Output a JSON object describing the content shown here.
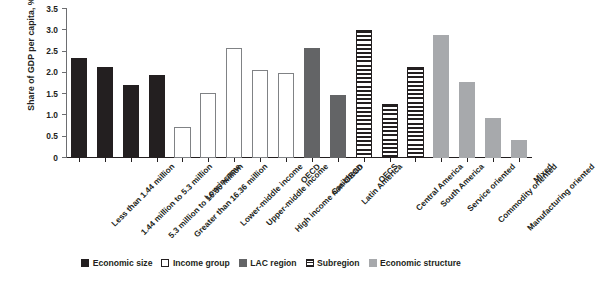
{
  "chart_data": {
    "type": "bar",
    "title": "",
    "subtitle": "",
    "xlabel": "",
    "ylabel": "Share of GDP per capita, %",
    "ylim": [
      0,
      3.5
    ],
    "ytick_labels": [
      "0",
      "0.5",
      "1.0",
      "1.5",
      "2.0",
      "2.5",
      "3.0",
      "3.5"
    ],
    "ytick_values": [
      0,
      0.5,
      1.0,
      1.5,
      2.0,
      2.5,
      3.0,
      3.5
    ],
    "grid": false,
    "legend_position": "bottom",
    "categories": [
      "Less than 1.44 million",
      "1.44 million to 5.3 million",
      "5.3 million to 16.36 million",
      "Greater than 16.36 million",
      "Low income",
      "Lower-middle income",
      "Upper-middle income",
      "High income non-OECD",
      "OECD",
      "Caribbean",
      "Latin America",
      "OECS",
      "Central America",
      "South America",
      "Service oriented",
      "Commodity oriented",
      "Manufacturing oriented",
      "Mixed"
    ],
    "values": [
      2.35,
      2.13,
      1.72,
      1.95,
      0.73,
      1.52,
      2.58,
      2.07,
      2.0,
      2.58,
      1.47,
      3.0,
      1.27,
      2.13,
      2.9,
      1.79,
      0.95,
      0.42
    ],
    "groups": [
      "Economic size",
      "Economic size",
      "Economic size",
      "Economic size",
      "Income group",
      "Income group",
      "Income group",
      "Income group",
      "Income group",
      "LAC region",
      "LAC region",
      "Subregion",
      "Subregion",
      "Subregion",
      "Economic structure",
      "Economic structure",
      "Economic structure",
      "Economic structure"
    ],
    "styles": [
      "solid-black",
      "solid-black",
      "solid-black",
      "solid-black",
      "outline-white",
      "outline-white",
      "outline-white",
      "outline-white",
      "outline-white",
      "solid-dark",
      "solid-dark",
      "striped",
      "striped",
      "striped",
      "solid-light",
      "solid-light",
      "solid-light",
      "solid-light"
    ],
    "legend": [
      {
        "label": "Economic size",
        "style": "solid-black",
        "color": "#231f20"
      },
      {
        "label": "Income group",
        "style": "outline-white",
        "color": "#ffffff"
      },
      {
        "label": "LAC region",
        "style": "solid-dark",
        "color": "#636466"
      },
      {
        "label": "Subregion",
        "style": "striped",
        "color": "#231f20"
      },
      {
        "label": "Economic structure",
        "style": "solid-light",
        "color": "#a7a9ac"
      }
    ]
  }
}
